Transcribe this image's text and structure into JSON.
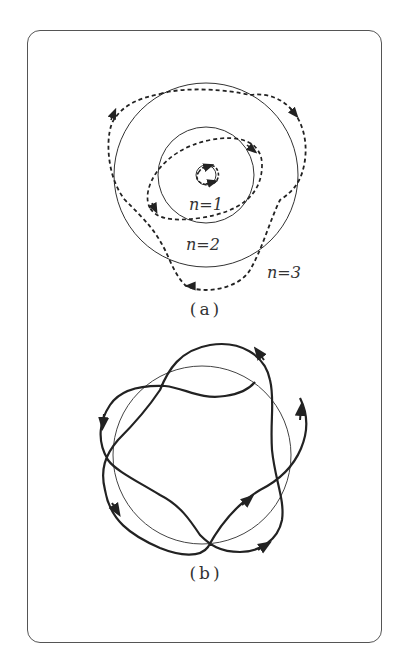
{
  "figure": {
    "panels": [
      {
        "id": "a",
        "caption": "(a)",
        "labels": [
          {
            "text": "n=1",
            "x": 205,
            "y": 207
          },
          {
            "text": "n=2",
            "x": 198,
            "y": 247
          },
          {
            "text": "n=3",
            "x": 282,
            "y": 275
          }
        ],
        "circles": [
          {
            "cx": 206,
            "cy": 175,
            "r": 10
          },
          {
            "cx": 206,
            "cy": 175,
            "r": 48
          },
          {
            "cx": 206,
            "cy": 175,
            "r": 92
          }
        ],
        "style": {
          "orbit_stroke": "#333333",
          "trajectory_dash": "4 3"
        }
      },
      {
        "id": "b",
        "caption": "(b)",
        "circles": [
          {
            "cx": 201,
            "cy": 455,
            "r": 90
          }
        ],
        "style": {
          "orbit_stroke": "#444444",
          "trajectory_stroke": "#222222"
        }
      }
    ]
  },
  "colors": {
    "frame": "#555555",
    "ink": "#222222",
    "background": "#ffffff"
  }
}
